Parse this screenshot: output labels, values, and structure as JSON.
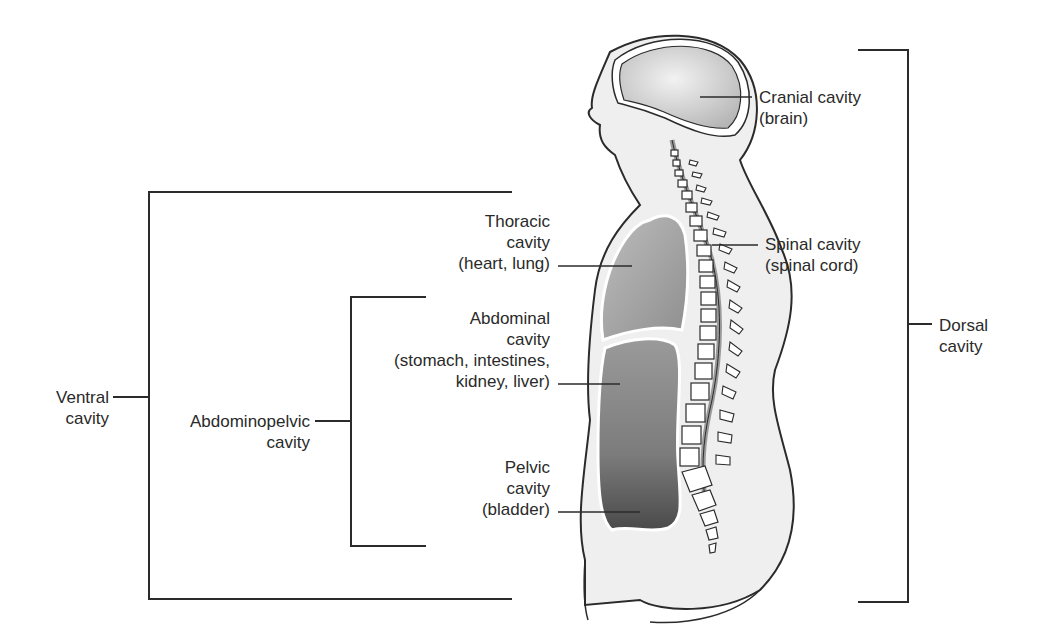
{
  "figure": {
    "colors": {
      "line": "#2b2b2b",
      "body_fill": "#ececec",
      "cavity_light": "#cfcfcf",
      "cavity_dark": "#7a7a7a",
      "bone": "#ffffff"
    }
  },
  "labels": {
    "cranial": {
      "line1": "Cranial cavity",
      "line2": "(brain)"
    },
    "spinal": {
      "line1": "Spinal cavity",
      "line2": "(spinal cord)"
    },
    "dorsal": {
      "line1": "Dorsal",
      "line2": "cavity"
    },
    "thoracic": {
      "line1": "Thoracic",
      "line2": "cavity",
      "line3": "(heart, lung)"
    },
    "abdominal": {
      "line1": "Abdominal",
      "line2": "cavity",
      "line3": "(stomach, intestines,",
      "line4": "kidney, liver)"
    },
    "pelvic": {
      "line1": "Pelvic",
      "line2": "cavity",
      "line3": "(bladder)"
    },
    "abdominopelvic": {
      "line1": "Abdominopelvic",
      "line2": "cavity"
    },
    "ventral": {
      "line1": "Ventral",
      "line2": "cavity"
    }
  },
  "brackets": {
    "dorsal": {
      "x": 908,
      "top": 50,
      "bottom": 602,
      "left": 858
    },
    "ventral": {
      "x": 149,
      "top": 192,
      "bottom": 599,
      "right": 512
    },
    "abdominopelvic": {
      "x": 351,
      "top": 297,
      "bottom": 546,
      "right": 426
    }
  }
}
